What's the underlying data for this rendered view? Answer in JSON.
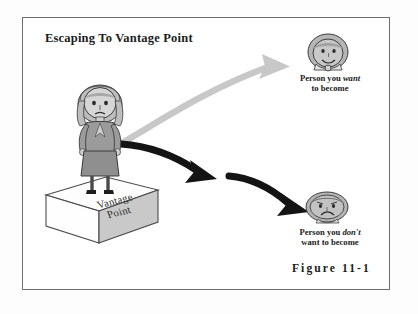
{
  "figure": {
    "title": "Escaping To Vantage Point",
    "caption": "Figure 11-1",
    "frame_color": "#6e6e6e",
    "background_color": "#ffffff"
  },
  "platform": {
    "line1": "Vantage",
    "line2": "Point",
    "face_color": "#c9c9c9",
    "top_color": "#ffffff"
  },
  "labels": {
    "want": {
      "prefix": "Person you ",
      "emphasis": "want",
      "suffix": "",
      "line2": "to become"
    },
    "dont": {
      "prefix": "Person you ",
      "emphasis": "don't",
      "suffix": "",
      "line2": "want to become"
    }
  },
  "arrows": [
    {
      "name": "arrow-to-desired-self",
      "color": "#c6c6c6",
      "from": "standing-person",
      "to": "happy-head",
      "direction": "up-right"
    },
    {
      "name": "arrow-to-undesired-self-segment-1",
      "color": "#141414",
      "from": "standing-person",
      "to": "midpoint",
      "direction": "right-down"
    },
    {
      "name": "arrow-to-undesired-self-segment-2",
      "color": "#141414",
      "from": "midpoint",
      "to": "sad-head",
      "direction": "right-down"
    }
  ],
  "characters": {
    "standing_person": {
      "name": "woman-on-vantage-point",
      "suit_color": "#9a9a9a",
      "skin_color": "#d4d4d4",
      "hair_color": "#bdbdbd"
    },
    "happy_head": {
      "name": "desired-self-head",
      "expression": "smiling",
      "face_color": "#c4c4c4"
    },
    "sad_head": {
      "name": "undesired-self-head",
      "expression": "frowning",
      "face_color": "#bcbcbc"
    }
  }
}
